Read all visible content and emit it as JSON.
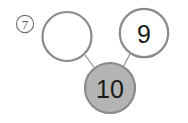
{
  "exercise": {
    "item_label": "7",
    "item_label_style": "circled-number"
  },
  "number_bond": {
    "whole": {
      "value": "10",
      "fill_color": "#b4b4b4",
      "stroke_color": "#8a8a8a",
      "text_color": "#1a1a1a"
    },
    "parts": [
      {
        "position": "left",
        "value": "",
        "fill_color": "#ffffff",
        "stroke_color": "#8a8a8a",
        "state": "blank"
      },
      {
        "position": "right",
        "value": "9",
        "fill_color": "#ffffff",
        "stroke_color": "#8a8a8a",
        "state": "filled"
      }
    ],
    "connector_color": "#8a8a8a"
  },
  "colors": {
    "background": "#ffffff",
    "outline": "#8a8a8a",
    "whole_fill": "#b4b4b4",
    "label": "#555555"
  }
}
